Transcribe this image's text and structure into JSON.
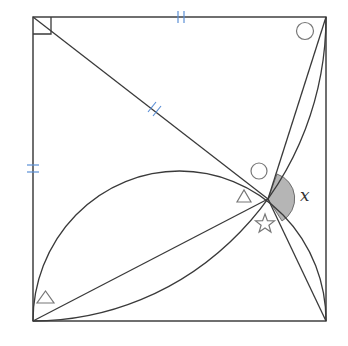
{
  "figure": {
    "type": "geometry-diagram",
    "shape": "square",
    "angle_label": "x",
    "colors": {
      "lines": "#333333",
      "tick_marks": "#5b8fd6",
      "angle_fill": "#b5b5b5",
      "markers": "#777777"
    },
    "markers": [
      {
        "symbol": "right-angle",
        "location": "top-left corner"
      },
      {
        "symbol": "circle",
        "location": "top-right corner angle"
      },
      {
        "symbol": "circle",
        "location": "above intersection point"
      },
      {
        "symbol": "triangle",
        "location": "left of intersection point"
      },
      {
        "symbol": "triangle",
        "location": "bottom-left corner angle"
      },
      {
        "symbol": "star",
        "location": "below intersection point"
      }
    ],
    "equal_length_marks": [
      "top side",
      "left side",
      "segment from top-left corner to intersection point"
    ],
    "shaded_angle": "x"
  }
}
